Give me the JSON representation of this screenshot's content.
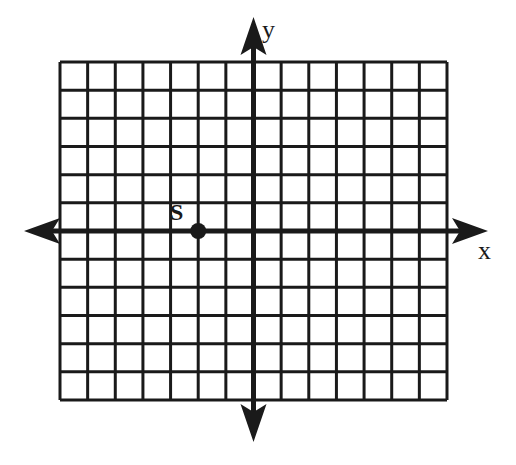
{
  "diagram": {
    "type": "coordinate-plane",
    "grid": {
      "columns": 14,
      "rows": 12,
      "x_min": -7,
      "x_max": 7,
      "y_min": -6,
      "y_max": 6,
      "line_color": "#1a1a1a"
    },
    "axes": {
      "x_label": "x",
      "y_label": "y",
      "color": "#1a1a1a"
    },
    "points": [
      {
        "label": "S",
        "x": -2,
        "y": 0
      }
    ]
  }
}
